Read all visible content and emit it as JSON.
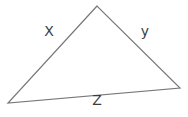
{
  "diagram": {
    "type": "triangle",
    "triangle_points": "97,6 8,103 180,88",
    "labels": {
      "left_side": "X",
      "right_side": "y",
      "bottom_side": "Z"
    }
  },
  "colors": {
    "line": "#77787b",
    "text": "#3d3d3f",
    "background": "#ffffff"
  }
}
